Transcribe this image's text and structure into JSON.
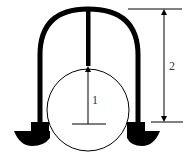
{
  "diagram": {
    "labels": {
      "inner_dimension": "1",
      "outer_dimension": "2"
    },
    "colors": {
      "stroke": "#000000",
      "background": "#ffffff",
      "text": "#333333"
    },
    "parts": [
      "arch",
      "center-rod",
      "circle",
      "left-foot",
      "right-foot",
      "dimension-1-arrow",
      "dimension-2-arrow"
    ]
  }
}
